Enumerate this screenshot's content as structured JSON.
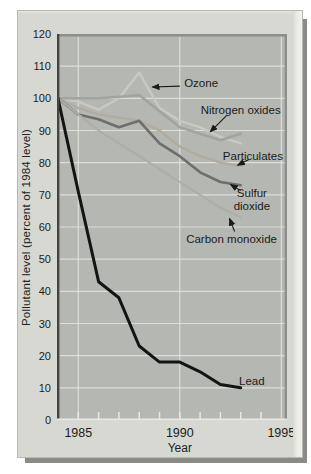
{
  "figure": {
    "y_axis_title": "Pollutant level (percent of 1984 level)",
    "x_axis_title": "Year"
  },
  "chart_data": {
    "type": "line",
    "title": "",
    "xlabel": "Year",
    "ylabel": "Pollutant level (percent of 1984 level)",
    "x": [
      1984,
      1985,
      1986,
      1987,
      1988,
      1989,
      1990,
      1991,
      1992,
      1993
    ],
    "series": [
      {
        "name": "Ozone",
        "color": "#c8c9c2",
        "width": 2.4,
        "values": [
          100,
          99,
          96.5,
          100,
          108,
          97,
          93,
          91,
          88,
          86
        ]
      },
      {
        "name": "Nitrogen oxides",
        "color": "#a2a49f",
        "width": 2.6,
        "values": [
          100,
          100,
          100,
          100.5,
          101,
          96,
          91,
          89,
          87,
          89
        ]
      },
      {
        "name": "Particulates",
        "color": "#b2ac9f",
        "width": 2.4,
        "values": [
          100,
          97,
          95,
          94,
          93,
          90,
          85,
          82,
          80,
          79
        ]
      },
      {
        "name": "Sulfur dioxide",
        "color": "#6e6e6c",
        "width": 2.6,
        "values": [
          100,
          95,
          93.5,
          91,
          93,
          86,
          82,
          77,
          74,
          73
        ]
      },
      {
        "name": "Carbon monoxide",
        "color": "#adadab",
        "width": 2.0,
        "values": [
          100,
          95,
          90,
          86,
          82,
          78,
          74,
          70,
          66,
          63
        ]
      },
      {
        "name": "Lead",
        "color": "#141414",
        "width": 3.0,
        "values": [
          100,
          71,
          43,
          38,
          23,
          18,
          18,
          15,
          11,
          10
        ]
      }
    ],
    "xlim": [
      1984,
      1995.3
    ],
    "ylim": [
      0,
      120
    ],
    "yticks": [
      0,
      10,
      20,
      30,
      40,
      50,
      60,
      70,
      80,
      90,
      100,
      110,
      120
    ],
    "xticks_labeled": [
      1985,
      1990,
      1995
    ],
    "xticks_minor": [
      1985,
      1986,
      1987,
      1988,
      1989,
      1990,
      1991,
      1992,
      1993,
      1994
    ],
    "gridlines": {
      "horizontal": [
        10,
        20,
        30,
        40,
        50,
        60,
        70,
        80,
        90,
        100,
        110
      ],
      "vertical": [
        1985,
        1990,
        1995
      ]
    },
    "grid_color": "#dcded8",
    "annotations": [
      {
        "label": "Ozone",
        "lines": [
          "Ozone"
        ],
        "text_at": [
          1991.05,
          104.8
        ],
        "arrow_from": [
          1990.0,
          103.8
        ],
        "arrow_to": [
          1988.65,
          103.5
        ]
      },
      {
        "label": "Nitrogen oxides",
        "lines": [
          "Nitrogen oxides"
        ],
        "text_at": [
          1993.0,
          96.4
        ],
        "arrow_from": [
          1992.3,
          94.6
        ],
        "arrow_to": [
          1991.5,
          89.6
        ]
      },
      {
        "label": "Particulates",
        "lines": [
          "Particulates"
        ],
        "text_at": [
          1993.6,
          82.1
        ],
        "arrow_from": [
          1993.4,
          81.0
        ],
        "arrow_to": [
          1992.85,
          79.2
        ]
      },
      {
        "label": "Sulfur dioxide",
        "lines": [
          "Sulfur",
          "dioxide"
        ],
        "text_at": [
          1993.55,
          68.3
        ],
        "arrow_from": [
          1993.0,
          71.3
        ],
        "arrow_to": [
          1992.5,
          73.2
        ]
      },
      {
        "label": "Carbon monoxide",
        "lines": [
          "Carbon monoxide"
        ],
        "text_at": [
          1992.55,
          56.4
        ],
        "arrow_from": [
          1992.7,
          58.6
        ],
        "arrow_to": [
          1992.45,
          62.6
        ]
      },
      {
        "label": "Lead",
        "lines": [
          "Lead"
        ],
        "text_at": [
          1993.55,
          12.2
        ]
      }
    ],
    "annotation_color": "#1b1b19",
    "axis_color": "#454542",
    "frame_color": "#8e908b"
  }
}
